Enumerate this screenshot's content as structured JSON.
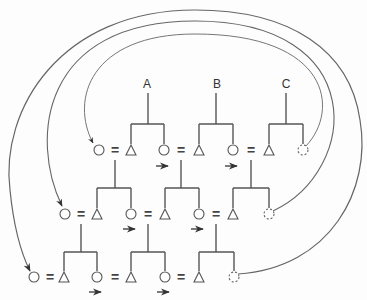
{
  "diagram": {
    "labels": {
      "a": "A",
      "b": "B",
      "c": "C"
    },
    "equals": "=",
    "rows": [
      {
        "name": "top",
        "y": 150,
        "equals_x": [
          115,
          181,
          251
        ]
      },
      {
        "name": "middle",
        "y": 214,
        "equals_x": [
          81,
          148,
          216
        ]
      },
      {
        "name": "bottom",
        "y": 277,
        "equals_x": [
          50,
          115,
          181
        ]
      }
    ],
    "colors": {
      "line": "#555555",
      "arc": "#666666",
      "background": "#fdfdfd"
    }
  }
}
